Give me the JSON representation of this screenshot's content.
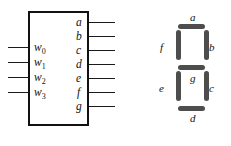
{
  "figure": {
    "name": "seven-segment-decoder-figure",
    "ink_color": "#111111",
    "segment_color": "#4d4d4d",
    "background_color": "#ffffff"
  },
  "decoder": {
    "block_label": "",
    "inputs": [
      {
        "base": "w",
        "sub": "0",
        "text": "w0"
      },
      {
        "base": "w",
        "sub": "1",
        "text": "w1"
      },
      {
        "base": "w",
        "sub": "2",
        "text": "w2"
      },
      {
        "base": "w",
        "sub": "3",
        "text": "w3"
      }
    ],
    "outputs": [
      {
        "label": "a"
      },
      {
        "label": "b"
      },
      {
        "label": "c"
      },
      {
        "label": "d"
      },
      {
        "label": "e"
      },
      {
        "label": "f"
      },
      {
        "label": "g"
      }
    ]
  },
  "display": {
    "type": "seven-segment",
    "segments": [
      {
        "id": "a",
        "label": "a",
        "orientation": "horizontal",
        "position": "top"
      },
      {
        "id": "b",
        "label": "b",
        "orientation": "vertical",
        "position": "upper-right"
      },
      {
        "id": "c",
        "label": "c",
        "orientation": "vertical",
        "position": "lower-right"
      },
      {
        "id": "d",
        "label": "d",
        "orientation": "horizontal",
        "position": "bottom"
      },
      {
        "id": "e",
        "label": "e",
        "orientation": "vertical",
        "position": "lower-left"
      },
      {
        "id": "f",
        "label": "f",
        "orientation": "vertical",
        "position": "upper-left"
      },
      {
        "id": "g",
        "label": "g",
        "orientation": "horizontal",
        "position": "middle"
      }
    ]
  }
}
